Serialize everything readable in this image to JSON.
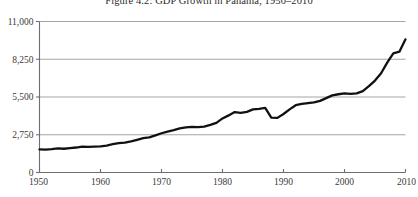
{
  "chart_data": {
    "type": "line",
    "title": "Figure 4.2: GDP Growth in Panama, 1950–2010",
    "xlabel": "",
    "ylabel": "",
    "xlim": [
      1950,
      2010
    ],
    "ylim": [
      0,
      11000
    ],
    "grid": true,
    "legend": null,
    "yticks": [
      0,
      2750,
      5500,
      8250,
      11000
    ],
    "ytick_labels": [
      "0",
      "2,750",
      "5,500",
      "8,250",
      "11,000"
    ],
    "xticks": [
      1950,
      1960,
      1970,
      1980,
      1990,
      2000,
      2010
    ],
    "xtick_labels": [
      "1950",
      "1960",
      "1970",
      "1980",
      "1990",
      "2000",
      "2010"
    ],
    "line_color": "#111111",
    "grid_color": "#9a9a9a",
    "axis_color": "#6e6e6e",
    "series": [
      {
        "name": "GDP per capita, Panama",
        "x": [
          1950,
          1951,
          1952,
          1953,
          1954,
          1955,
          1956,
          1957,
          1958,
          1959,
          1960,
          1961,
          1962,
          1963,
          1964,
          1965,
          1966,
          1967,
          1968,
          1969,
          1970,
          1971,
          1972,
          1973,
          1974,
          1975,
          1976,
          1977,
          1978,
          1979,
          1980,
          1981,
          1982,
          1983,
          1984,
          1985,
          1986,
          1987,
          1988,
          1989,
          1990,
          1991,
          1992,
          1993,
          1994,
          1995,
          1996,
          1997,
          1998,
          1999,
          2000,
          2001,
          2002,
          2003,
          2004,
          2005,
          2006,
          2007,
          2008,
          2009,
          2010
        ],
        "values": [
          1690,
          1660,
          1700,
          1760,
          1730,
          1780,
          1820,
          1890,
          1870,
          1880,
          1900,
          1960,
          2060,
          2140,
          2180,
          2270,
          2380,
          2500,
          2560,
          2700,
          2860,
          2980,
          3080,
          3210,
          3290,
          3320,
          3300,
          3340,
          3470,
          3620,
          3940,
          4160,
          4400,
          4350,
          4420,
          4600,
          4640,
          4700,
          4000,
          3980,
          4260,
          4600,
          4900,
          5000,
          5060,
          5110,
          5220,
          5420,
          5620,
          5700,
          5760,
          5730,
          5760,
          5930,
          6290,
          6700,
          7230,
          8000,
          8680,
          8800,
          9700
        ]
      }
    ]
  },
  "figure": {
    "title_text": "Figure 4.2: GDP Growth in Panama, 1950–2010"
  }
}
